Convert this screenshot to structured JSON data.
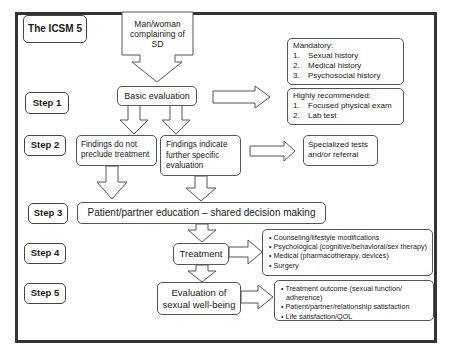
{
  "title": "The ICSM 5",
  "steps": [
    "Step 1",
    "Step 2",
    "Step 3",
    "Step 4",
    "Step 5"
  ],
  "nodes": {
    "start": "Man/woman complaining of SD",
    "basic_evaluation": "Basic evaluation",
    "mandatory": {
      "heading": "Mandatory:",
      "items": [
        {
          "n": "1.",
          "text": "Sexual history"
        },
        {
          "n": "2.",
          "text": "Medical history"
        },
        {
          "n": "3.",
          "text": "Psychosocial history"
        }
      ]
    },
    "recommended": {
      "heading": "Highly recommended:",
      "items": [
        {
          "n": "1.",
          "text": "Focused physical exam"
        },
        {
          "n": "2.",
          "text": "Lab test"
        }
      ]
    },
    "findings_not_preclude": "Findings do not preclude treatment",
    "findings_indicate": "Findings indicate further specific evaluation",
    "specialized": "Specialized tests and/or referral",
    "education": "Patient/partner education – shared decision making",
    "treatment": "Treatment",
    "treatment_options": [
      "Counseling/lifestyle modifications",
      "Psychological (cognitive/behavioral/sex therapy)",
      "Medical (pharmacotherapy, devices)",
      "Surgery"
    ],
    "evaluation": "Evaluation of sexual well-being",
    "evaluation_outcomes": [
      "Treatment outcome (sexual function/ adherence)",
      "Patient/partner/relationship satisfaction",
      "Life satisfaction/QOL"
    ]
  }
}
